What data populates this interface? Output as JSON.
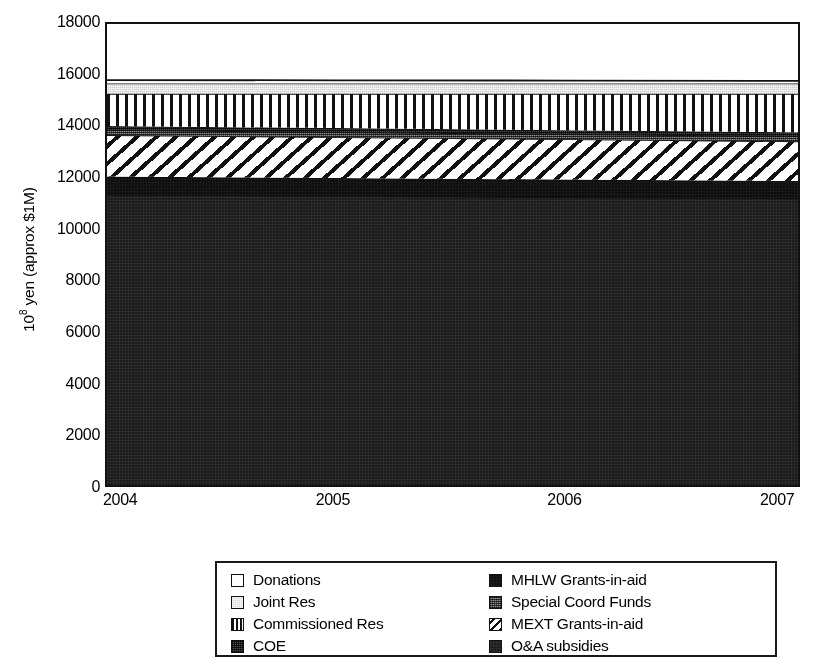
{
  "chart_data": {
    "type": "area",
    "stacked": true,
    "title": "",
    "subtitle": "",
    "xlabel": "",
    "ylabel": "10⁸ yen (approx $1M)",
    "x": [
      2004,
      2005,
      2006,
      2007
    ],
    "xticklabels": [
      "2004",
      "2005",
      "2006",
      "2007"
    ],
    "yticklabels": [
      "0",
      "2000",
      "4000",
      "6000",
      "8000",
      "10000",
      "12000",
      "14000",
      "16000",
      "18000"
    ],
    "ytickvalues": [
      0,
      2000,
      4000,
      6000,
      8000,
      10000,
      12000,
      14000,
      16000,
      18000
    ],
    "xlim": [
      2004,
      2007
    ],
    "ylim": [
      0,
      18000
    ],
    "grid": false,
    "legend_position": "below-plot",
    "legend_columns": 2,
    "stack_order_bottom_to_top": [
      "O&A subsidies",
      "MHLW Grants-in-aid",
      "MEXT Grants-in-aid",
      "Special Coord Funds",
      "COE",
      "Commissioned Res",
      "Joint Res",
      "Donations"
    ],
    "series": [
      {
        "name": "O&A subsidies",
        "pattern": "near-black-dotted",
        "color": "#1b1b1b",
        "values": [
          11400,
          11350,
          11300,
          11250
        ],
        "cumulative_top": [
          11400,
          11350,
          11300,
          11250
        ]
      },
      {
        "name": "MHLW Grants-in-aid",
        "pattern": "solid-black",
        "color": "#0d0d0d",
        "values": [
          700,
          690,
          680,
          670
        ],
        "cumulative_top": [
          12100,
          12040,
          11980,
          11920
        ]
      },
      {
        "name": "MEXT Grants-in-aid",
        "pattern": "diagonal-stripes",
        "color": "#ffffff",
        "values": [
          1600,
          1580,
          1560,
          1540
        ],
        "cumulative_top": [
          13700,
          13620,
          13540,
          13460
        ]
      },
      {
        "name": "Special Coord Funds",
        "pattern": "medium-gray-dotted",
        "color": "#5d5d5d",
        "values": [
          200,
          200,
          200,
          200
        ],
        "cumulative_top": [
          13900,
          13820,
          13740,
          13660
        ]
      },
      {
        "name": "COE",
        "pattern": "dark-gray-dotted",
        "color": "#4a4a4a",
        "values": [
          150,
          150,
          150,
          150
        ],
        "cumulative_top": [
          14050,
          13970,
          13890,
          13810
        ]
      },
      {
        "name": "Commissioned Res",
        "pattern": "vertical-stripes",
        "color": "#ffffff",
        "values": [
          1250,
          1330,
          1410,
          1490
        ],
        "cumulative_top": [
          15300,
          15300,
          15300,
          15300
        ]
      },
      {
        "name": "Joint Res",
        "pattern": "light-gray",
        "color": "#d2d2d2",
        "values": [
          400,
          400,
          400,
          400
        ],
        "cumulative_top": [
          15700,
          15700,
          15700,
          15700
        ]
      },
      {
        "name": "Donations",
        "pattern": "white",
        "color": "#ffffff",
        "values": [
          130,
          120,
          110,
          100
        ],
        "cumulative_top": [
          15830,
          15820,
          15810,
          15800
        ]
      }
    ],
    "legend_entries": [
      {
        "label": "Donations",
        "pattern": "white"
      },
      {
        "label": "Joint Res",
        "pattern": "light-gray"
      },
      {
        "label": "Commissioned Res",
        "pattern": "vertical-stripes"
      },
      {
        "label": "COE",
        "pattern": "dark-gray-dotted"
      },
      {
        "label": "MHLW Grants-in-aid",
        "pattern": "solid-black"
      },
      {
        "label": "Special Coord Funds",
        "pattern": "medium-gray-dotted"
      },
      {
        "label": "MEXT Grants-in-aid",
        "pattern": "diagonal-stripes"
      },
      {
        "label": "O&A subsidies",
        "pattern": "near-black-dotted"
      }
    ]
  },
  "axes": {
    "ylabel_prefix": "10",
    "ylabel_exponent": "8",
    "ylabel_suffix": " yen (approx $1M)"
  },
  "legend": {
    "left_column": [
      {
        "label": "Donations",
        "swatch_class": "p-white"
      },
      {
        "label": "Joint Res",
        "swatch_class": "p-lightgray"
      },
      {
        "label": "Commissioned Res",
        "swatch_class": "p-vstripe"
      },
      {
        "label": "COE",
        "swatch_class": "p-darkdot"
      }
    ],
    "right_column": [
      {
        "label": "MHLW Grants-in-aid",
        "swatch_class": "p-black"
      },
      {
        "label": "Special Coord Funds",
        "swatch_class": "p-middot"
      },
      {
        "label": "MEXT Grants-in-aid",
        "swatch_class": "p-diag"
      },
      {
        "label": "O&A subsidies",
        "swatch_class": "p-nearblack"
      }
    ]
  }
}
